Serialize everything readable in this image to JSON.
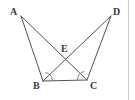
{
  "figure": {
    "background_color": "#ffffff",
    "line_color": "#555555",
    "label_color": "#3a3a3a",
    "border_color": "#cfcfcf",
    "canvas": {
      "width": 135,
      "height": 100
    },
    "points": [
      {
        "id": "A",
        "label": "A",
        "x": 21,
        "y": 16,
        "label_x": 10,
        "label_y": 15
      },
      {
        "id": "D",
        "label": "D",
        "x": 111,
        "y": 16,
        "label_x": 113,
        "label_y": 15
      },
      {
        "id": "E",
        "label": "E",
        "x": 65,
        "y": 59,
        "label_x": 61,
        "label_y": 52
      },
      {
        "id": "B",
        "label": "B",
        "x": 43,
        "y": 81,
        "label_x": 33,
        "label_y": 89
      },
      {
        "id": "C",
        "label": "C",
        "x": 87,
        "y": 80,
        "label_x": 90,
        "label_y": 89
      }
    ],
    "segments": [
      {
        "id": "AB",
        "from": "A",
        "to": "B",
        "x1": 21,
        "y1": 16,
        "x2": 43,
        "y2": 81
      },
      {
        "id": "AC",
        "from": "A",
        "to": "C",
        "x1": 21,
        "y1": 16,
        "x2": 87,
        "y2": 80
      },
      {
        "id": "DB",
        "from": "D",
        "to": "B",
        "x1": 111,
        "y1": 16,
        "x2": 43,
        "y2": 81
      },
      {
        "id": "DC",
        "from": "D",
        "to": "C",
        "x1": 111,
        "y1": 16,
        "x2": 87,
        "y2": 80
      },
      {
        "id": "BC",
        "from": "B",
        "to": "C",
        "x1": 43,
        "y1": 81,
        "x2": 87,
        "y2": 80
      }
    ],
    "angle_marks": [
      {
        "id": "angle-B",
        "at": "B",
        "path": "M 45.5 72.5 A 9 9 0 0 1 52.5 80.8"
      },
      {
        "id": "angle-C",
        "at": "C",
        "path": "M 77.5 79.9 A 9 9 0 0 1 84.3 71.5"
      }
    ],
    "right_edge_x": 128
  }
}
